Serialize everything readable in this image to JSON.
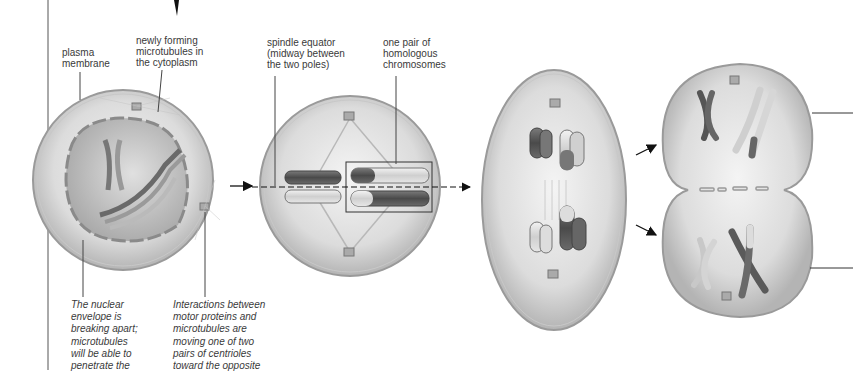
{
  "diagram": {
    "type": "meiosis-I-stages",
    "colors": {
      "background": "#ffffff",
      "cell_fill": "#d4d4d4",
      "cell_edge": "#9a9a9a",
      "nucleus_fill": "#bdbdbd",
      "chromosome_dark": "#5a5a5a",
      "chromosome_light": "#d8d8d8",
      "text": "#3a3a3a",
      "line": "#333333"
    },
    "labels": {
      "plasma_membrane": "plasma\nmembrane",
      "newly_forming_microtubules": "newly forming\nmicrotubules in\nthe cytoplasm",
      "spindle_equator": "spindle equator\n(midway between\nthe two poles)",
      "homologous_pair": "one pair of\nhomologous\nchromosomes"
    },
    "captions": {
      "nuclear_envelope": "The nuclear\nenvelope is\nbreaking apart;\nmicrotubules\nwill be able to\npenetrate the",
      "motor_proteins": "Interactions between\nmotor proteins and\nmicrotubules are\nmoving one of two\npairs of centrioles\ntoward the opposite"
    },
    "stages": [
      {
        "name": "prophase-I",
        "shape": "circle"
      },
      {
        "name": "metaphase-I",
        "shape": "circle"
      },
      {
        "name": "anaphase-I",
        "shape": "ellipse"
      },
      {
        "name": "telophase-I",
        "shape": "dividing-cell"
      }
    ]
  }
}
